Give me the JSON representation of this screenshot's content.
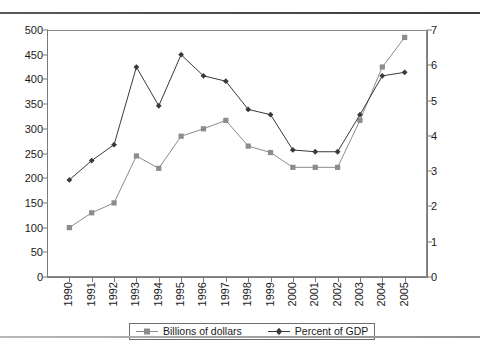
{
  "chart_data": {
    "type": "line",
    "title": "",
    "subtitle": "",
    "xlabel": "",
    "ylabel": "",
    "grid": false,
    "legend_position": "bottom-center",
    "categories": [
      "1990",
      "1991",
      "1992",
      "1993",
      "1994",
      "1995",
      "1996",
      "1997",
      "1998",
      "1999",
      "2000",
      "2001",
      "2002",
      "2003",
      "2004",
      "2005"
    ],
    "axes": {
      "left": {
        "label": "Billions of dollars",
        "ylim": [
          0,
          500
        ],
        "tick_step": 50,
        "ticks": [
          0,
          50,
          100,
          150,
          200,
          250,
          300,
          350,
          400,
          450,
          500
        ]
      },
      "right": {
        "label": "Percent of GDP",
        "ylim": [
          0,
          7
        ],
        "tick_step": 1,
        "ticks": [
          0,
          1,
          2,
          3,
          4,
          5,
          6,
          7
        ]
      }
    },
    "series": [
      {
        "name": "Billions of dollars",
        "axis": "left",
        "marker": "square",
        "color": "#8c8c8c",
        "values": [
          100,
          130,
          150,
          245,
          220,
          285,
          300,
          317,
          265,
          252,
          222,
          222,
          222,
          317,
          425,
          485
        ]
      },
      {
        "name": "Percent of GDP",
        "axis": "right",
        "marker": "diamond",
        "color": "#3a3a3a",
        "values": [
          2.75,
          3.3,
          3.75,
          5.95,
          4.85,
          6.3,
          5.7,
          5.55,
          4.75,
          4.6,
          3.6,
          3.55,
          3.55,
          4.6,
          5.7,
          5.8
        ]
      }
    ]
  },
  "legend": {
    "items": [
      {
        "label": "Billions of dollars",
        "marker": "square-marker",
        "color": "#8c8c8c"
      },
      {
        "label": "Percent of GDP",
        "marker": "diamond-marker",
        "color": "#3a3a3a"
      }
    ]
  },
  "colors": {
    "billions": "#8c8c8c",
    "percent": "#3a3a3a",
    "axis": "#7a7a7a",
    "frame": "#8a8a8a",
    "rule_top": "#4a4a4a",
    "rule_bottom": "#a0a0a0"
  }
}
